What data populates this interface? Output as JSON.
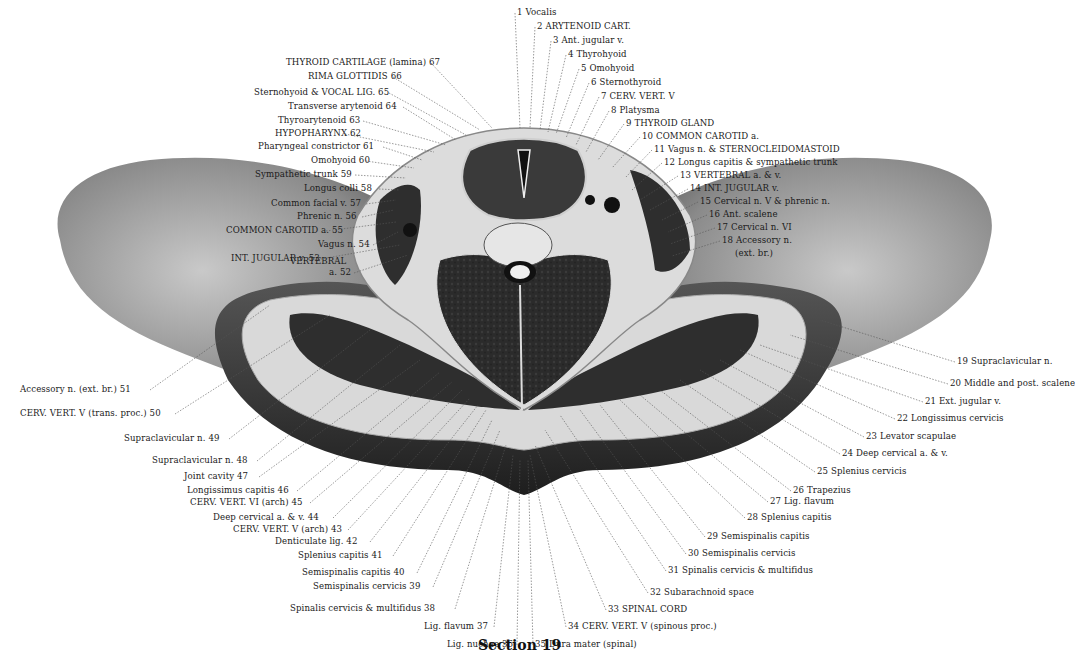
{
  "figure": {
    "caption": "Section 19",
    "colors": {
      "tissue_dark": "#2a2a2a",
      "skin_gray": "#7a7a7a",
      "fat_light": "#d8d8d8",
      "paper": "#ffffff",
      "ink": "#1a1a1a"
    }
  },
  "labels_right": [
    "1 Vocalis",
    "2 ARYTENOID CART.",
    "3 Ant. jugular v.",
    "4 Thyrohyoid",
    "5 Omohyoid",
    "6 Sternothyroid",
    "7 CERV. VERT. V",
    "8 Platysma",
    "9 THYROID GLAND",
    "10 COMMON CAROTID a.",
    "11 Vagus n. & STERNOCLEIDOMASTOID",
    "12 Longus capitis & sympathetic trunk",
    "13 VERTEBRAL a. & v.",
    "14 INT. JUGULAR v.",
    "15 Cervical n. V & phrenic n.",
    "16 Ant. scalene",
    "17 Cervical n. VI",
    "18 Accessory n.",
    "(ext. br.)",
    "19 Supraclavicular n.",
    "20 Middle and post. scalene",
    "21 Ext. jugular v.",
    "22 Longissimus cervicis",
    "23 Levator scapulae",
    "24 Deep cervical a. & v.",
    "25 Splenius cervicis",
    "26 Trapezius",
    "27 Lig. flavum",
    "28 Splenius capitis",
    "29 Semispinalis capitis",
    "30 Semispinalis cervicis",
    "31 Spinalis cervicis & multifidus",
    "32 Subarachnoid space",
    "33 SPINAL CORD",
    "34 CERV. VERT. V (spinous proc.)",
    "35 Dura mater (spinal)"
  ],
  "labels_left": [
    "Lig. nuchae 36",
    "Lig. flavum 37",
    "Spinalis cervicis & multifidus 38",
    "Semispinalis cervicis 39",
    "Semispinalis capitis 40",
    "Splenius capitis 41",
    "Denticulate lig. 42",
    "CERV. VERT. V (arch) 43",
    "Deep cervical a. & v. 44",
    "CERV. VERT. VI (arch) 45",
    "Longissimus capitis 46",
    "Joint cavity 47",
    "Supraclavicular n. 48",
    "Supraclavicular n. 49",
    "CERV. VERT. V (trans. proc.) 50",
    "Accessory n. (ext. br.) 51",
    "VERTEBRAL",
    "a. 52",
    "INT. JUGULAR v. 53",
    "Vagus n. 54",
    "COMMON CAROTID a. 55",
    "Phrenic n. 56",
    "Common facial v. 57",
    "Longus colli 58",
    "Sympathetic trunk 59",
    "Omohyoid 60",
    "Pharyngeal constrictor 61",
    "HYPOPHARYNX 62",
    "Thyroarytenoid 63",
    "Transverse arytenoid 64",
    "Sternohyoid & VOCAL LIG. 65",
    "RIMA GLOTTIDIS 66",
    "THYROID CARTILAGE (lamina) 67"
  ]
}
